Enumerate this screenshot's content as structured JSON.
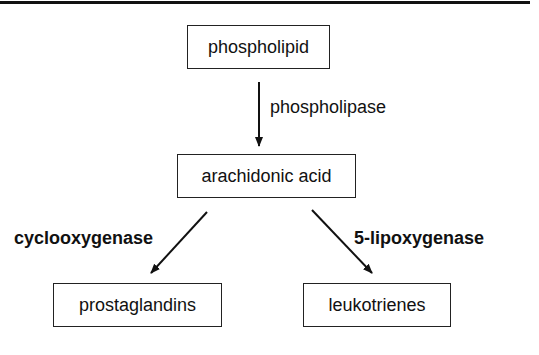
{
  "nodes": {
    "phospholipid": "phospholipid",
    "arachidonic_acid": "arachidonic acid",
    "prostaglandins": "prostaglandins",
    "leukotrienes": "leukotrienes"
  },
  "edges": {
    "phospholipase": "phospholipase",
    "cyclooxygenase": "cyclooxygenase",
    "lipoxygenase": "5-lipoxygenase"
  }
}
